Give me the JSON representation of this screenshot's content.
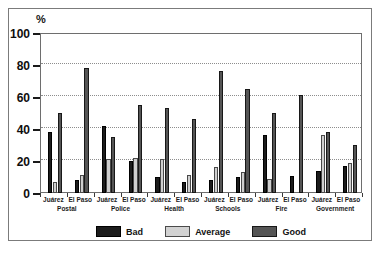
{
  "chart_data": {
    "type": "bar",
    "title": "",
    "subtitle": "",
    "xlabel": "",
    "ylabel": "%",
    "ylim": [
      0,
      100
    ],
    "yticks": [
      0,
      20,
      40,
      60,
      80,
      100
    ],
    "ytick_labels": [
      "0",
      "20",
      "40",
      "60",
      "80",
      "100"
    ],
    "grid": "horizontal-dotted",
    "legend_position": "bottom",
    "categories": [
      "Juárez",
      "El Paso",
      "Juárez",
      "El Paso",
      "Juárez",
      "El Paso",
      "Juárez",
      "El Paso",
      "Juárez",
      "El Paso",
      "Juárez",
      "El Paso"
    ],
    "group_labels": [
      "Postal",
      "Police",
      "Health",
      "Schools",
      "Fire",
      "Government"
    ],
    "series": [
      {
        "name": "Bad",
        "color": "#1c1c1c",
        "values": [
          38,
          8,
          42,
          20,
          10,
          7,
          8,
          10,
          36,
          10.5,
          13.5,
          17
        ]
      },
      {
        "name": "Average",
        "color": "#cfcfcf",
        "values": [
          7,
          11,
          21,
          22,
          21,
          11,
          16,
          13,
          9,
          0,
          36,
          18.5
        ]
      },
      {
        "name": "Good",
        "color": "#555555",
        "values": [
          50,
          78,
          35,
          55,
          53,
          46,
          76,
          65,
          50,
          61,
          38,
          30
        ]
      }
    ]
  },
  "legend": {
    "entries": [
      {
        "label": "Bad",
        "swatch": "bad"
      },
      {
        "label": "Average",
        "swatch": "average"
      },
      {
        "label": "Good",
        "swatch": "good"
      }
    ]
  },
  "axis": {
    "y_unit_label": "%"
  }
}
